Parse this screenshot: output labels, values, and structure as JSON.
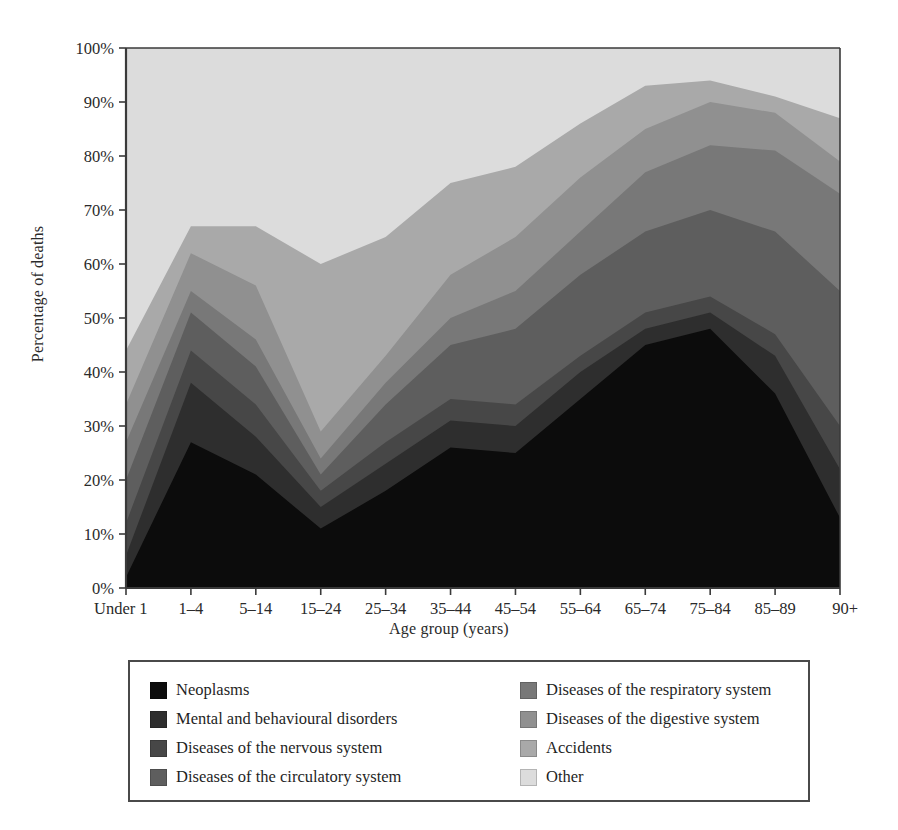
{
  "chart_data": {
    "type": "area",
    "stacked": true,
    "normalized": true,
    "title": "",
    "xlabel": "Age group (years)",
    "ylabel": "Percentage of deaths",
    "grid": false,
    "legend_position": "bottom",
    "ylim": [
      0,
      100
    ],
    "ytick_labels": [
      "0%",
      "10%",
      "20%",
      "30%",
      "40%",
      "50%",
      "60%",
      "70%",
      "80%",
      "90%",
      "100%"
    ],
    "ytick_values": [
      0,
      10,
      20,
      30,
      40,
      50,
      60,
      70,
      80,
      90,
      100
    ],
    "categories": [
      "Under 1",
      "1–4",
      "5–14",
      "15–24",
      "25–34",
      "35–44",
      "45–54",
      "55–64",
      "65–74",
      "75–84",
      "85–89",
      "90+"
    ],
    "series": [
      {
        "name": "Neoplasms",
        "color": "#0c0c0c",
        "values": [
          2,
          27,
          21,
          11,
          18,
          26,
          25,
          35,
          45,
          48,
          36,
          13
        ]
      },
      {
        "name": "Mental and behavioural disorders",
        "color": "#2e2e2e",
        "values": [
          4,
          11,
          7,
          4,
          5,
          5,
          5,
          5,
          3,
          3,
          7,
          9
        ]
      },
      {
        "name": "Diseases of the nervous system",
        "color": "#474747",
        "values": [
          6,
          6,
          6,
          3,
          4,
          4,
          4,
          3,
          3,
          3,
          4,
          8
        ]
      },
      {
        "name": "Diseases of the circulatory system",
        "color": "#5e5e5e",
        "values": [
          8,
          7,
          7,
          3,
          7,
          10,
          14,
          15,
          15,
          16,
          19,
          25
        ]
      },
      {
        "name": "Diseases of the respiratory system",
        "color": "#787878",
        "values": [
          7,
          4,
          5,
          3,
          4,
          5,
          7,
          8,
          11,
          12,
          15,
          18
        ]
      },
      {
        "name": "Diseases of the digestive system",
        "color": "#909090",
        "values": [
          7,
          7,
          10,
          5,
          5,
          8,
          10,
          10,
          8,
          8,
          7,
          6
        ]
      },
      {
        "name": "Accidents",
        "color": "#a9a9a9",
        "values": [
          10,
          5,
          11,
          31,
          22,
          17,
          13,
          10,
          8,
          4,
          3,
          8
        ]
      },
      {
        "name": "Other",
        "color": "#dcdcdc",
        "values": [
          56,
          33,
          33,
          40,
          35,
          25,
          22,
          14,
          7,
          6,
          9,
          13
        ]
      }
    ],
    "cumulative_tops": [
      [
        2,
        27,
        21,
        11,
        18,
        26,
        25,
        35,
        45,
        48,
        36,
        13
      ],
      [
        6,
        38,
        28,
        15,
        23,
        31,
        30,
        40,
        48,
        51,
        43,
        22
      ],
      [
        12,
        44,
        34,
        18,
        27,
        35,
        34,
        43,
        51,
        54,
        47,
        30
      ],
      [
        20,
        51,
        41,
        21,
        34,
        45,
        48,
        58,
        66,
        70,
        66,
        55
      ],
      [
        27,
        55,
        46,
        24,
        38,
        50,
        55,
        66,
        77,
        82,
        81,
        73
      ],
      [
        34,
        62,
        56,
        29,
        43,
        58,
        65,
        76,
        85,
        90,
        88,
        79
      ],
      [
        44,
        67,
        67,
        60,
        65,
        75,
        78,
        86,
        93,
        94,
        91,
        87
      ],
      [
        100,
        100,
        100,
        100,
        100,
        100,
        100,
        100,
        100,
        100,
        100,
        100
      ]
    ]
  },
  "legend": {
    "items": [
      {
        "label": "Neoplasms",
        "color": "#0c0c0c"
      },
      {
        "label": "Diseases of the respiratory system",
        "color": "#787878"
      },
      {
        "label": "Mental and behavioural disorders",
        "color": "#2e2e2e"
      },
      {
        "label": "Diseases of the digestive system",
        "color": "#909090"
      },
      {
        "label": "Diseases of the nervous system",
        "color": "#474747"
      },
      {
        "label": "Accidents",
        "color": "#a9a9a9"
      },
      {
        "label": "Diseases of the circulatory system",
        "color": "#5e5e5e"
      },
      {
        "label": "Other",
        "color": "#dcdcdc"
      }
    ]
  }
}
